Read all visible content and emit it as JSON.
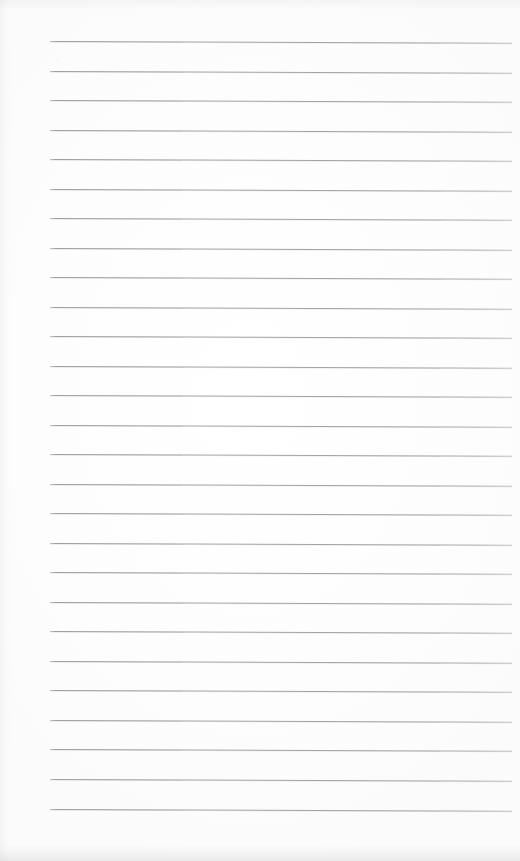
{
  "document": {
    "kind": "lined-paper-scan",
    "title": "Blank Ruled Notebook Page",
    "page_width": 520,
    "page_height": 861,
    "text_content": "",
    "handwriting_present": "none",
    "printed_text_present": "none"
  },
  "paper": {
    "background_color": "#fefefe",
    "surface_tint": "#fdfdfd",
    "edge_shadow_color": "#a8a8a8",
    "grain_opacity": "0.55"
  },
  "ruling": {
    "style": "wide-ruled horizontal lines",
    "line_color": "#a2a2a2",
    "line_color_left": "#9d9d9d",
    "line_color_right": "#a8a8a8",
    "line_thickness_px": 1,
    "line_count": 26,
    "first_line_y": 41,
    "line_spacing_px": 29.5,
    "left_x": 50,
    "right_x": 512,
    "line_length_px": 462,
    "skew_degrees": 0.22,
    "lines": [
      {
        "index": 1,
        "y": 41,
        "x": 50,
        "length": 462
      },
      {
        "index": 2,
        "y": 71,
        "x": 50,
        "length": 462
      },
      {
        "index": 3,
        "y": 100,
        "x": 50,
        "length": 462
      },
      {
        "index": 4,
        "y": 130,
        "x": 50,
        "length": 462
      },
      {
        "index": 5,
        "y": 159,
        "x": 50,
        "length": 462
      },
      {
        "index": 6,
        "y": 189,
        "x": 50,
        "length": 462
      },
      {
        "index": 7,
        "y": 218,
        "x": 50,
        "length": 462
      },
      {
        "index": 8,
        "y": 248,
        "x": 50,
        "length": 462
      },
      {
        "index": 9,
        "y": 277,
        "x": 50,
        "length": 462
      },
      {
        "index": 10,
        "y": 307,
        "x": 50,
        "length": 462
      },
      {
        "index": 11,
        "y": 336,
        "x": 50,
        "length": 462
      },
      {
        "index": 12,
        "y": 366,
        "x": 50,
        "length": 462
      },
      {
        "index": 13,
        "y": 395,
        "x": 50,
        "length": 462
      },
      {
        "index": 14,
        "y": 425,
        "x": 50,
        "length": 462
      },
      {
        "index": 15,
        "y": 454,
        "x": 50,
        "length": 462
      },
      {
        "index": 16,
        "y": 484,
        "x": 50,
        "length": 462
      },
      {
        "index": 17,
        "y": 513,
        "x": 50,
        "length": 462
      },
      {
        "index": 18,
        "y": 543,
        "x": 50,
        "length": 462
      },
      {
        "index": 19,
        "y": 572,
        "x": 50,
        "length": 462
      },
      {
        "index": 20,
        "y": 602,
        "x": 50,
        "length": 462
      },
      {
        "index": 21,
        "y": 631,
        "x": 50,
        "length": 462
      },
      {
        "index": 22,
        "y": 661,
        "x": 50,
        "length": 462
      },
      {
        "index": 23,
        "y": 690,
        "x": 50,
        "length": 462
      },
      {
        "index": 24,
        "y": 720,
        "x": 50,
        "length": 462
      },
      {
        "index": 25,
        "y": 749,
        "x": 50,
        "length": 462
      },
      {
        "index": 26,
        "y": 779,
        "x": 50,
        "length": 462
      },
      {
        "index": 27,
        "y": 809,
        "x": 50,
        "length": 462
      }
    ]
  },
  "margins": {
    "left_px": 50,
    "right_px": 8,
    "top_px": 41,
    "bottom_px": 52
  },
  "writing_area": {
    "label": "",
    "placeholder": "",
    "left": 50,
    "top": 41,
    "width": 463,
    "height": 769
  }
}
